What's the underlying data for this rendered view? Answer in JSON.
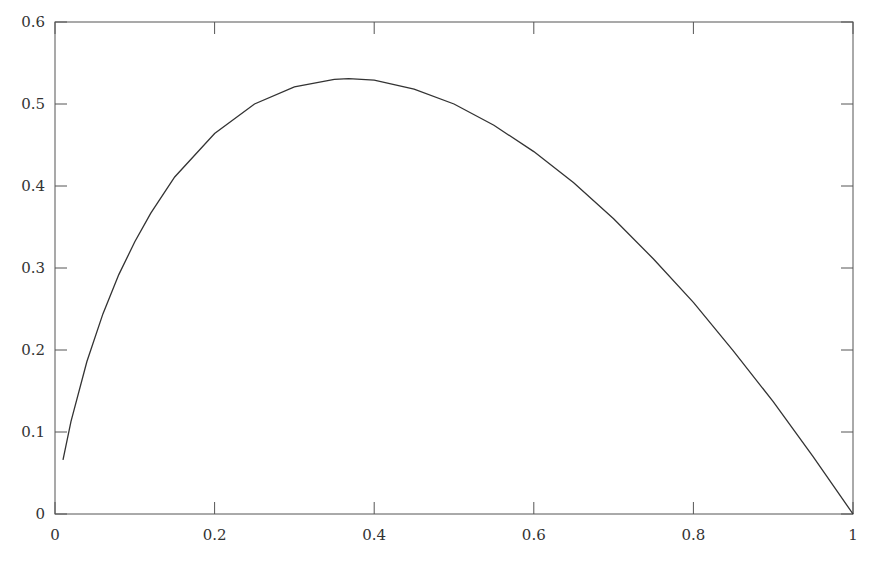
{
  "chart_data": {
    "type": "line",
    "title": "",
    "xlabel": "",
    "ylabel": "",
    "xlim": [
      0,
      1
    ],
    "ylim": [
      0,
      0.6
    ],
    "grid": false,
    "legend": null,
    "x_ticks": [
      0,
      0.2,
      0.4,
      0.6,
      0.8,
      1
    ],
    "x_tick_labels": [
      "0",
      "0.2",
      "0.4",
      "0.6",
      "0.8",
      "1"
    ],
    "y_ticks": [
      0,
      0.1,
      0.2,
      0.3,
      0.4,
      0.5,
      0.6
    ],
    "y_tick_labels": [
      "0",
      "0.1",
      "0.2",
      "0.3",
      "0.4",
      "0.5",
      "0.6"
    ],
    "series": [
      {
        "name": "curve",
        "color": "#333333",
        "x": [
          0.01,
          0.02,
          0.04,
          0.06,
          0.08,
          0.1,
          0.12,
          0.15,
          0.2,
          0.25,
          0.3,
          0.35,
          0.368,
          0.4,
          0.45,
          0.5,
          0.55,
          0.6,
          0.65,
          0.7,
          0.75,
          0.8,
          0.85,
          0.9,
          0.95,
          1.0
        ],
        "y": [
          0.066,
          0.113,
          0.186,
          0.244,
          0.292,
          0.332,
          0.367,
          0.411,
          0.464,
          0.5,
          0.521,
          0.53,
          0.531,
          0.529,
          0.518,
          0.5,
          0.474,
          0.442,
          0.404,
          0.36,
          0.311,
          0.258,
          0.199,
          0.137,
          0.07,
          0.0
        ]
      }
    ]
  }
}
